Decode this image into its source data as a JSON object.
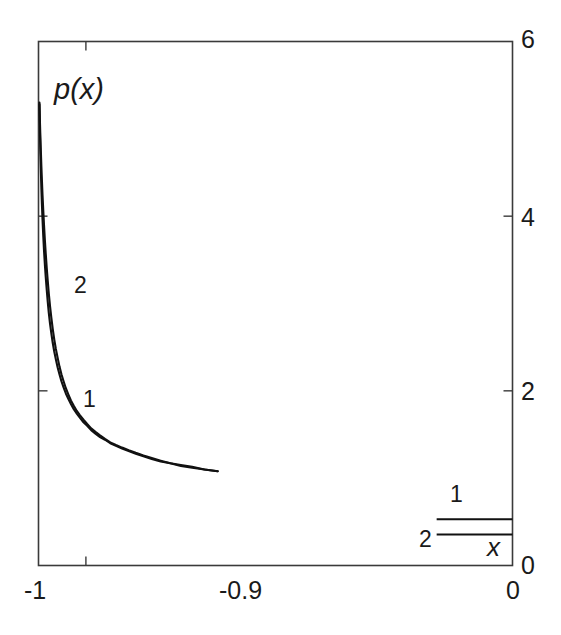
{
  "chart_data": {
    "type": "line",
    "title": "",
    "subtitle": "",
    "xlabel": "x",
    "ylabel": "p(x)",
    "xlim": [
      -1,
      0
    ],
    "ylim": [
      0,
      6
    ],
    "grid": false,
    "legend_position": "bottom-right-inside",
    "x_ticks": [
      {
        "value": -1,
        "label": "-1"
      },
      {
        "value": -0.9,
        "label": "-0.9"
      },
      {
        "value": 0,
        "label": "0"
      }
    ],
    "y_ticks": [
      {
        "value": 0,
        "label": "0"
      },
      {
        "value": 2,
        "label": "2"
      },
      {
        "value": 4,
        "label": "4"
      },
      {
        "value": 6,
        "label": "6"
      }
    ],
    "y_axis_side": "right",
    "annotations": [
      {
        "text": "p(x)",
        "x": -0.965,
        "y": 5.55,
        "role": "y-axis-title"
      },
      {
        "text": "2",
        "x": -0.922,
        "y": 3.28,
        "role": "curve-label"
      },
      {
        "text": "1",
        "x": -0.901,
        "y": 1.99,
        "role": "curve-label"
      },
      {
        "text": "x",
        "x": -0.043,
        "y": 0.21,
        "role": "x-axis-title"
      }
    ],
    "series": [
      {
        "name": "1",
        "label": "1",
        "color": "#111111",
        "x": [
          -0.998,
          -0.9974,
          -0.9968,
          -0.996,
          -0.995,
          -0.994,
          -0.9928,
          -0.9915,
          -0.99,
          -0.9884,
          -0.9866,
          -0.9847,
          -0.9827,
          -0.9805,
          -0.9782,
          -0.9757,
          -0.973,
          -0.97,
          -0.9668,
          -0.9634,
          -0.9597,
          -0.9558,
          -0.9516,
          -0.9471,
          -0.9423,
          -0.9371,
          -0.9316,
          -0.9256,
          -0.9192,
          -0.9124,
          -0.9051,
          -0.8973,
          -0.8889,
          -0.8799,
          -0.8702,
          -0.8598,
          -0.8486,
          -0.8366,
          -0.8237,
          -0.8098,
          -0.7948,
          -0.7786,
          -0.7611,
          -0.7422,
          -0.7218,
          -0.6997,
          -0.6758,
          -0.6499,
          -0.6219
        ],
        "y": [
          5.28,
          5.1,
          4.92,
          4.72,
          4.52,
          4.33,
          4.14,
          3.96,
          3.78,
          3.61,
          3.45,
          3.3,
          3.16,
          3.02,
          2.89,
          2.77,
          2.66,
          2.55,
          2.45,
          2.36,
          2.27,
          2.19,
          2.11,
          2.04,
          1.97,
          1.91,
          1.85,
          1.79,
          1.74,
          1.69,
          1.64,
          1.6,
          1.55,
          1.51,
          1.47,
          1.44,
          1.4,
          1.37,
          1.34,
          1.31,
          1.28,
          1.25,
          1.22,
          1.19,
          1.17,
          1.14,
          1.12,
          1.1,
          1.08
        ]
      },
      {
        "name": "2",
        "label": "2",
        "color": "#111111",
        "x": [
          -0.998,
          -0.9974,
          -0.9968,
          -0.996,
          -0.995,
          -0.994,
          -0.9928,
          -0.9915,
          -0.99,
          -0.9884,
          -0.9866,
          -0.9847,
          -0.9827,
          -0.9805,
          -0.9782,
          -0.9757,
          -0.973,
          -0.97,
          -0.9668,
          -0.9634,
          -0.9597,
          -0.9558,
          -0.9516,
          -0.9471,
          -0.9423,
          -0.9371,
          -0.9316,
          -0.9256,
          -0.9192,
          -0.9124,
          -0.9051,
          -0.8973,
          -0.8889,
          -0.8799,
          -0.8702,
          -0.8598,
          -0.8486,
          -0.8366,
          -0.8237,
          -0.8098,
          -0.7948,
          -0.7786,
          -0.7611,
          -0.7422,
          -0.7218,
          -0.6997,
          -0.6758,
          -0.6499,
          -0.6219
        ],
        "y": [
          5.3,
          5.18,
          5.05,
          4.9,
          4.74,
          4.58,
          4.41,
          4.24,
          4.07,
          3.9,
          3.73,
          3.57,
          3.41,
          3.26,
          3.11,
          2.97,
          2.84,
          2.71,
          2.59,
          2.48,
          2.38,
          2.28,
          2.19,
          2.11,
          2.03,
          1.96,
          1.89,
          1.83,
          1.77,
          1.72,
          1.67,
          1.62,
          1.57,
          1.53,
          1.49,
          1.45,
          1.41,
          1.38,
          1.35,
          1.32,
          1.29,
          1.26,
          1.23,
          1.2,
          1.17,
          1.15,
          1.13,
          1.1,
          1.08
        ]
      }
    ],
    "legend_entries": [
      {
        "label": "1",
        "x_start": -0.16,
        "x_end": 0.0,
        "y": 0.53
      },
      {
        "label": "2",
        "x_start": -0.16,
        "x_end": 0.0,
        "y": 0.355
      }
    ]
  }
}
